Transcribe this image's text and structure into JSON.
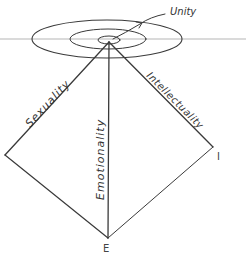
{
  "diagram": {
    "type": "hand-drawn pyramid with concentric ellipses",
    "labels": {
      "top": "Unity",
      "left_edge": "Sexuality",
      "center_edge": "Emotionality",
      "right_edge": "Intellectuality",
      "bottom_vertex": "E",
      "right_vertex": "I"
    },
    "colors": {
      "ink": "#3a3a3a",
      "horizon": "#b5b5b5",
      "background": "#ffffff"
    }
  }
}
